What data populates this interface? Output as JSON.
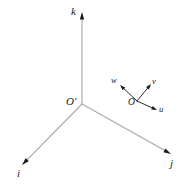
{
  "figure": {
    "type": "vector-diagram",
    "background_color": "#ffffff",
    "width": 182,
    "height": 186
  },
  "style": {
    "fixed_axis_color": "#a8a8a8",
    "moving_axis_color": "#2a2a2a",
    "arrowhead_color": "#1a1a1a",
    "label_color": "#1a1a1a",
    "fixed_axis_stroke_width": 1.1,
    "moving_axis_stroke_width": 1.0
  },
  "fixed_frame": {
    "origin": {
      "label": "O'",
      "x": 82,
      "y": 104,
      "label_x": 66,
      "label_y": 96
    },
    "axes": [
      {
        "name": "k",
        "label": "k",
        "direction": "up",
        "from_x": 82,
        "from_y": 104,
        "to_x": 82,
        "to_y": 12,
        "label_x": 71,
        "label_y": 6
      },
      {
        "name": "i",
        "label": "i",
        "direction": "down-left",
        "from_x": 82,
        "from_y": 104,
        "to_x": 22,
        "to_y": 165,
        "label_x": 17,
        "label_y": 168
      },
      {
        "name": "j",
        "label": "j",
        "direction": "down-right",
        "from_x": 82,
        "from_y": 104,
        "to_x": 171,
        "to_y": 154,
        "label_x": 170,
        "label_y": 158
      }
    ]
  },
  "moving_frame": {
    "origin": {
      "label": "O",
      "x": 137,
      "y": 101,
      "label_x": 128,
      "label_y": 98
    },
    "axes": [
      {
        "name": "w",
        "label": "w",
        "direction": "up-left",
        "from_x": 137,
        "from_y": 101,
        "to_x": 120,
        "to_y": 85,
        "label_x": 111,
        "label_y": 76
      },
      {
        "name": "v",
        "label": "v",
        "direction": "up-right",
        "from_x": 137,
        "from_y": 101,
        "to_x": 151,
        "to_y": 84,
        "label_x": 152,
        "label_y": 77
      },
      {
        "name": "u",
        "label": "u",
        "direction": "down-right",
        "from_x": 137,
        "from_y": 101,
        "to_x": 157,
        "to_y": 110,
        "label_x": 159,
        "label_y": 105
      }
    ]
  }
}
